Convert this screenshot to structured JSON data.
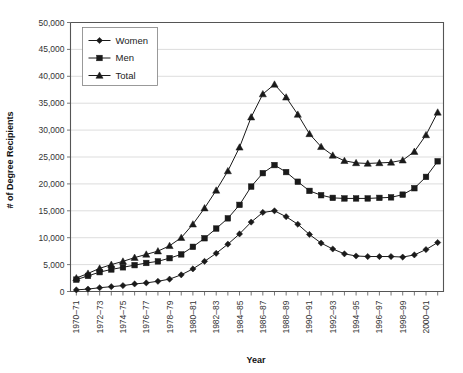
{
  "chart_data": {
    "type": "line",
    "title": "",
    "xlabel": "Year",
    "ylabel": "# of Degree Recipients",
    "ylim": [
      0,
      50000
    ],
    "ytick_labels": [
      "50,000",
      "45,000",
      "40,000",
      "35,000",
      "30,000",
      "25,000",
      "20,000",
      "15,000",
      "10,000",
      "5,000",
      "0"
    ],
    "ytick_values": [
      50000,
      45000,
      40000,
      35000,
      30000,
      25000,
      20000,
      15000,
      10000,
      5000,
      0
    ],
    "grid": true,
    "legend_position": "top-left",
    "categories": [
      "1970-71",
      "1971-72",
      "1972-73",
      "1973-74",
      "1974-75",
      "1975-76",
      "1976-77",
      "1977-78",
      "1978-79",
      "1979-80",
      "1980-81",
      "1981-82",
      "1982-83",
      "1983-84",
      "1984-85",
      "1985-86",
      "1986-87",
      "1987-88",
      "1988-89",
      "1989-90",
      "1990-91",
      "1991-92",
      "1992-93",
      "1993-94",
      "1994-95",
      "1995-96",
      "1996-97",
      "1997-98",
      "1998-99",
      "1999-00",
      "2000-01",
      "2001-02"
    ],
    "xtick_labels_shown": [
      "1970-71",
      "1972-73",
      "1974-75",
      "1976-77",
      "1978-79",
      "1980-81",
      "1982-83",
      "1984-85",
      "1986-87",
      "1988-89",
      "1990-91",
      "1992-93",
      "1994-95",
      "1996-97",
      "1998-99",
      "2000-01"
    ],
    "series": [
      {
        "name": "Women",
        "marker": "diamond",
        "values": [
          300,
          450,
          700,
          900,
          1100,
          1400,
          1600,
          1900,
          2300,
          3100,
          4200,
          5600,
          7100,
          8800,
          10700,
          12900,
          14700,
          15000,
          13900,
          12500,
          10600,
          9000,
          7900,
          7000,
          6600,
          6500,
          6500,
          6500,
          6400,
          6800,
          7800,
          9100
        ]
      },
      {
        "name": "Men",
        "marker": "square",
        "values": [
          2200,
          2900,
          3600,
          4100,
          4500,
          4900,
          5300,
          5600,
          6200,
          6900,
          8300,
          9900,
          11700,
          13600,
          16100,
          19500,
          22000,
          23500,
          22200,
          20400,
          18700,
          17900,
          17400,
          17300,
          17300,
          17300,
          17400,
          17500,
          18000,
          19200,
          21300,
          24200
        ]
      },
      {
        "name": "Total",
        "marker": "triangle",
        "values": [
          2500,
          3350,
          4300,
          5000,
          5600,
          6300,
          6900,
          7500,
          8500,
          10000,
          12500,
          15500,
          18800,
          22400,
          26800,
          32400,
          36700,
          38500,
          36100,
          32900,
          29300,
          26900,
          25300,
          24300,
          23900,
          23800,
          23900,
          24000,
          24400,
          26000,
          29100,
          33300
        ]
      }
    ],
    "series_alt_note": ""
  },
  "legend": {
    "items": [
      {
        "label": "Women"
      },
      {
        "label": "Men"
      },
      {
        "label": "Total"
      }
    ]
  }
}
